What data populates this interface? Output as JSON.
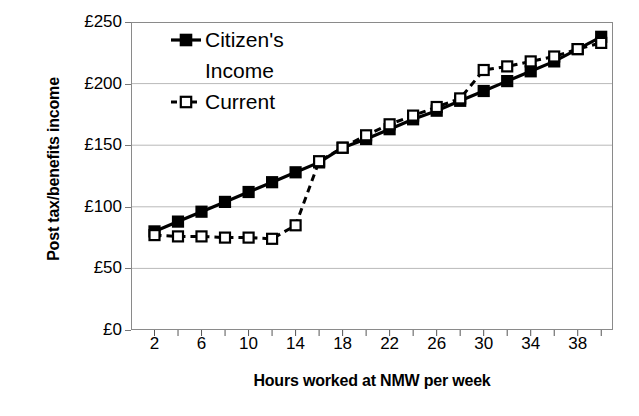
{
  "chart_data": {
    "type": "line",
    "title": "",
    "xlabel": "Hours worked at NMW per week",
    "ylabel": "Post tax/benefits income",
    "xlim": [
      0,
      41
    ],
    "ylim": [
      0,
      250
    ],
    "grid": true,
    "legend_position": "top-left inside plot",
    "x": [
      2,
      4,
      6,
      8,
      10,
      12,
      14,
      16,
      18,
      20,
      22,
      24,
      26,
      28,
      30,
      32,
      34,
      36,
      38,
      40
    ],
    "xticks": [
      2,
      4,
      6,
      8,
      10,
      12,
      14,
      16,
      18,
      20,
      22,
      24,
      26,
      28,
      30,
      32,
      34,
      36,
      38,
      40
    ],
    "xticklabels": [
      "2",
      "",
      "6",
      "",
      "10",
      "",
      "14",
      "",
      "18",
      "",
      "22",
      "",
      "26",
      "",
      "30",
      "",
      "34",
      "",
      "38",
      ""
    ],
    "yticks": [
      0,
      50,
      100,
      150,
      200,
      250
    ],
    "yticklabels": [
      "£0",
      "£50",
      "£100",
      "£150",
      "£200",
      "£250"
    ],
    "series": [
      {
        "name": "Citizen's Income",
        "marker": "filled-square",
        "linestyle": "solid",
        "color": "#000000",
        "values": [
          80,
          88,
          96,
          104,
          112,
          120,
          128,
          136,
          148,
          155,
          163,
          171,
          178,
          186,
          194,
          202,
          210,
          218,
          228,
          238
        ]
      },
      {
        "name": "Current",
        "marker": "open-square",
        "linestyle": "dashed",
        "color": "#000000",
        "values": [
          77,
          76,
          76,
          75,
          75,
          74,
          85,
          137,
          148,
          158,
          167,
          174,
          181,
          188,
          211,
          214,
          218,
          222,
          228,
          233
        ]
      }
    ]
  },
  "legend": {
    "items": [
      {
        "label_line1": "Citizen's",
        "label_line2": "Income"
      },
      {
        "label_line1": "Current",
        "label_line2": ""
      }
    ]
  },
  "axis": {
    "ylabel": "Post tax/benefits income",
    "xlabel": "Hours worked at NMW per week"
  }
}
